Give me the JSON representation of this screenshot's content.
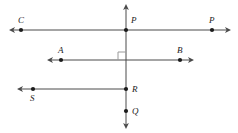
{
  "diagram": {
    "stroke_color": "#4a4a4a",
    "dot_color": "#1b1b1b",
    "label_color": "#1b1b1b",
    "background_color": "#ffffff",
    "width": 238,
    "height": 133,
    "labels": {
      "c": "C",
      "p_center": "P",
      "p_right": "P",
      "a": "A",
      "b": "B",
      "r": "R",
      "s": "S",
      "q": "Q"
    },
    "points": [
      {
        "name": "C",
        "x": 21,
        "y": 30
      },
      {
        "name": "P",
        "x": 126,
        "y": 30
      },
      {
        "name": "P",
        "x": 212,
        "y": 30
      },
      {
        "name": "A",
        "x": 61,
        "y": 60
      },
      {
        "name": "B",
        "x": 180,
        "y": 60
      },
      {
        "name": "S",
        "x": 33,
        "y": 89
      },
      {
        "name": "R",
        "x": 126,
        "y": 89
      },
      {
        "name": "Q",
        "x": 126,
        "y": 111
      }
    ],
    "lines": [
      {
        "name": "vertical-line",
        "x1": 126,
        "y1": 6,
        "x2": 126,
        "y2": 127,
        "arrow_start": true,
        "arrow_end": true
      },
      {
        "name": "line-c-p",
        "x1": 11,
        "y1": 30,
        "x2": 229,
        "y2": 30,
        "arrow_start": true,
        "arrow_end": true
      },
      {
        "name": "line-a-b",
        "x1": 49,
        "y1": 60,
        "x2": 192,
        "y2": 60,
        "arrow_start": true,
        "arrow_end": true
      },
      {
        "name": "ray-s-r",
        "x1": 19,
        "y1": 89,
        "x2": 126,
        "y2": 89,
        "arrow_start": true,
        "arrow_end": false
      }
    ],
    "right_angle": {
      "name": "right-angle-mark",
      "vertex_x": 126,
      "vertex_y": 60,
      "size": 8,
      "quadrant": "upper-left"
    }
  }
}
